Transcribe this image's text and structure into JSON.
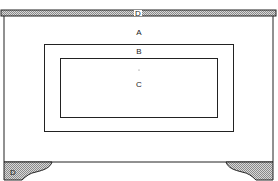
{
  "diagram": {
    "type": "panel-elevation",
    "colors": {
      "line": "#222222",
      "hatch": "#bdbdbd",
      "background": "#ffffff"
    },
    "labels": {
      "top_rail": "D",
      "outer_field": "A",
      "border": "B",
      "center_panel": "C",
      "foot": "D"
    },
    "parts": [
      {
        "id": "top_rail",
        "label": "D",
        "shaded": true
      },
      {
        "id": "outer_field",
        "label": "A",
        "shaded": false
      },
      {
        "id": "border",
        "label": "B",
        "shaded": false
      },
      {
        "id": "center_panel",
        "label": "C",
        "shaded": false
      },
      {
        "id": "left_foot",
        "label": "D",
        "shaded": true
      },
      {
        "id": "right_foot",
        "label": "",
        "shaded": true
      }
    ]
  }
}
